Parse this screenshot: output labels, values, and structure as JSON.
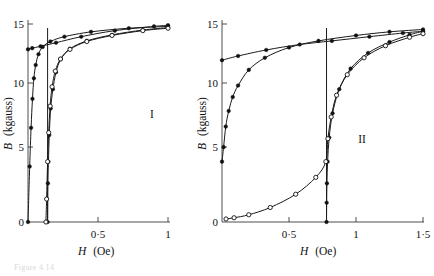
{
  "figure": {
    "background_color": "#ffffff",
    "ink_color": "#111111",
    "axis_color": "#3a3a3a",
    "caption_partial": "Figure 4.14"
  },
  "chart_data": [
    {
      "type": "line",
      "title": "",
      "panel_label": "I",
      "xlabel": "H (Oe)",
      "ylabel": "B (kgauss)",
      "xlim": [
        0,
        1
      ],
      "ylim": [
        0,
        16.4
      ],
      "xticks": [
        0,
        0.5,
        1
      ],
      "xtick_labels": [
        "0",
        "0·5",
        "1"
      ],
      "yticks": [
        0,
        5,
        10,
        15
      ],
      "ytick_labels": [
        "0",
        "5",
        "10",
        "15"
      ],
      "grid": false,
      "legend": "none",
      "vertical_marker_x": 0.14,
      "series": [
        {
          "name": "upper-saturation-branch",
          "marker": "filled-circle",
          "x": [
            0.0,
            0.03,
            0.09,
            0.2,
            0.38,
            0.62,
            0.9,
            1.0
          ],
          "y": [
            14.3,
            14.4,
            14.55,
            14.85,
            15.35,
            15.85,
            16.2,
            16.3
          ]
        },
        {
          "name": "initial-magnetization-curve",
          "marker": "filled-circle",
          "x": [
            0.0,
            0.012,
            0.022,
            0.032,
            0.042,
            0.055,
            0.075,
            0.105,
            0.16,
            0.26,
            0.45,
            0.72,
            1.0
          ],
          "y": [
            0.0,
            4.6,
            7.8,
            10.2,
            11.9,
            13.0,
            13.9,
            14.5,
            14.95,
            15.35,
            15.75,
            16.05,
            16.2
          ]
        },
        {
          "name": "hysteresis-branch-filled",
          "marker": "filled-circle",
          "x": [
            0.14,
            0.142,
            0.146,
            0.152,
            0.162,
            0.178,
            0.2,
            0.235,
            0.3,
            0.42,
            0.6,
            0.82,
            1.0
          ],
          "y": [
            0.0,
            3.2,
            5.0,
            7.2,
            9.4,
            11.0,
            12.4,
            13.5,
            14.35,
            15.0,
            15.5,
            15.9,
            16.1
          ]
        },
        {
          "name": "hysteresis-branch-open",
          "marker": "open-circle",
          "x": [
            0.128,
            0.133,
            0.14,
            0.148,
            0.158,
            0.172,
            0.195,
            0.232,
            0.3,
            0.42,
            0.6,
            0.82,
            1.0
          ],
          "y": [
            0.0,
            1.9,
            5.0,
            7.4,
            9.6,
            11.2,
            12.5,
            13.5,
            14.3,
            14.95,
            15.45,
            15.85,
            16.05
          ]
        }
      ]
    },
    {
      "type": "line",
      "title": "",
      "panel_label": "II",
      "xlabel": "H (Oe)",
      "ylabel": "B (kgauss)",
      "xlim": [
        0,
        1.5
      ],
      "ylim": [
        0,
        16.4
      ],
      "xticks": [
        0,
        0.5,
        1,
        1.5
      ],
      "xtick_labels": [
        "0",
        "0·5",
        "1",
        "1·5"
      ],
      "yticks": [
        0,
        5,
        10,
        15
      ],
      "ytick_labels": [
        "0",
        "5",
        "10",
        "15"
      ],
      "grid": false,
      "legend": "none",
      "vertical_marker_x": 0.78,
      "series": [
        {
          "name": "upper-saturation-branch",
          "marker": "filled-circle",
          "x": [
            0.0,
            0.12,
            0.33,
            0.58,
            0.82,
            1.1,
            1.35,
            1.5
          ],
          "y": [
            13.4,
            13.75,
            14.25,
            14.7,
            15.0,
            15.35,
            15.65,
            15.8
          ]
        },
        {
          "name": "initial-magnetization-curve",
          "marker": "filled-circle",
          "x": [
            0.0,
            0.012,
            0.028,
            0.05,
            0.08,
            0.12,
            0.2,
            0.32,
            0.5,
            0.72,
            1.0,
            1.25,
            1.5
          ],
          "y": [
            5.0,
            6.2,
            7.9,
            9.2,
            10.35,
            11.3,
            12.6,
            13.6,
            14.45,
            15.0,
            15.45,
            15.75,
            15.95
          ]
        },
        {
          "name": "hysteresis-branch-filled",
          "marker": "filled-circle",
          "x": [
            0.78,
            0.781,
            0.783,
            0.788,
            0.8,
            0.825,
            0.875,
            0.96,
            1.09,
            1.25,
            1.4,
            1.5
          ],
          "y": [
            0.0,
            1.6,
            3.2,
            5.0,
            7.0,
            9.0,
            11.0,
            12.7,
            14.0,
            14.9,
            15.5,
            15.8
          ]
        },
        {
          "name": "hysteresis-branch-open",
          "marker": "open-circle",
          "x": [
            0.03,
            0.09,
            0.2,
            0.36,
            0.55,
            0.7,
            0.775,
            0.79,
            0.815,
            0.855,
            0.935,
            1.06,
            1.22,
            1.4,
            1.5
          ],
          "y": [
            0.25,
            0.35,
            0.6,
            1.2,
            2.3,
            3.7,
            5.0,
            6.9,
            8.7,
            10.5,
            12.2,
            13.6,
            14.6,
            15.3,
            15.6
          ]
        }
      ]
    }
  ],
  "panels": [
    {
      "id": "panel-1",
      "label": "I",
      "xlabel_italic": "H",
      "xlabel_unit": "(Oe)",
      "ylabel_italic": "B",
      "ylabel_unit": "(kgauss)",
      "xtick_labels": [
        "0",
        "0·5",
        "1"
      ],
      "ytick_labels": [
        "0",
        "5",
        "10",
        "15"
      ]
    },
    {
      "id": "panel-2",
      "label": "II",
      "xlabel_italic": "H",
      "xlabel_unit": "(Oe)",
      "ylabel_italic": "B",
      "ylabel_unit": "(kgauss)",
      "xtick_labels": [
        "0",
        "0·5",
        "1",
        "1·5"
      ],
      "ytick_labels": [
        "0",
        "5",
        "10",
        "15"
      ]
    }
  ]
}
